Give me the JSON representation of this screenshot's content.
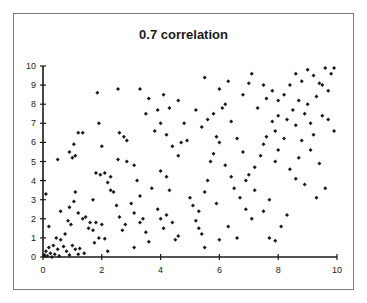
{
  "chart_data": {
    "type": "scatter",
    "title": "0.7 correlation",
    "xlabel": "",
    "ylabel": "",
    "xlim": [
      0,
      10
    ],
    "ylim": [
      0,
      10
    ],
    "x_ticks": [
      0,
      2,
      4,
      6,
      8,
      10
    ],
    "y_ticks": [
      0,
      1,
      2,
      3,
      4,
      5,
      6,
      7,
      8,
      9,
      10
    ],
    "grid": false,
    "legend": null,
    "marker": "diamond",
    "marker_color": "#1a1a1a",
    "points": [
      [
        0.05,
        0.1
      ],
      [
        0.1,
        0.3
      ],
      [
        0.15,
        0.05
      ],
      [
        0.2,
        0.5
      ],
      [
        0.25,
        0.2
      ],
      [
        0.3,
        0.0
      ],
      [
        0.35,
        0.6
      ],
      [
        0.4,
        0.15
      ],
      [
        0.5,
        0.4
      ],
      [
        0.55,
        0.05
      ],
      [
        0.1,
        3.3
      ],
      [
        0.2,
        1.6
      ],
      [
        0.45,
        1.0
      ],
      [
        0.6,
        0.9
      ],
      [
        0.7,
        0.55
      ],
      [
        0.8,
        0.3
      ],
      [
        0.9,
        0.1
      ],
      [
        0.6,
        2.4
      ],
      [
        0.85,
        1.9
      ],
      [
        0.95,
        1.7
      ],
      [
        1.0,
        0.6
      ],
      [
        1.1,
        0.4
      ],
      [
        1.2,
        0.15
      ],
      [
        1.25,
        0.45
      ],
      [
        1.4,
        0.2
      ],
      [
        0.75,
        1.2
      ],
      [
        0.9,
        2.6
      ],
      [
        1.05,
        2.9
      ],
      [
        1.1,
        3.4
      ],
      [
        1.2,
        2.3
      ],
      [
        1.35,
        2.0
      ],
      [
        1.45,
        2.1
      ],
      [
        1.55,
        1.5
      ],
      [
        1.6,
        1.8
      ],
      [
        1.7,
        1.4
      ],
      [
        1.75,
        0.75
      ],
      [
        1.8,
        1.8
      ],
      [
        1.9,
        1.0
      ],
      [
        2.0,
        1.7
      ],
      [
        2.1,
        0.95
      ],
      [
        1.0,
        5.2
      ],
      [
        1.1,
        5.3
      ],
      [
        0.9,
        5.5
      ],
      [
        1.05,
        5.9
      ],
      [
        1.2,
        6.5
      ],
      [
        1.35,
        6.5
      ],
      [
        0.5,
        5.1
      ],
      [
        1.8,
        4.4
      ],
      [
        1.95,
        4.3
      ],
      [
        2.1,
        4.4
      ],
      [
        2.2,
        3.9
      ],
      [
        2.3,
        3.5
      ],
      [
        2.4,
        3.4
      ],
      [
        2.5,
        2.7
      ],
      [
        2.6,
        2.1
      ],
      [
        2.7,
        1.4
      ],
      [
        2.8,
        1.7
      ],
      [
        2.2,
        0.3
      ],
      [
        2.3,
        4.2
      ],
      [
        1.7,
        3.0
      ],
      [
        1.9,
        7.0
      ],
      [
        1.85,
        8.6
      ],
      [
        2.55,
        8.8
      ],
      [
        2.75,
        6.3
      ],
      [
        2.85,
        6.1
      ],
      [
        2.6,
        6.5
      ],
      [
        2.0,
        5.8
      ],
      [
        2.55,
        5.1
      ],
      [
        2.85,
        5.0
      ],
      [
        3.1,
        4.8
      ],
      [
        3.2,
        4.0
      ],
      [
        3.0,
        2.8
      ],
      [
        3.1,
        2.3
      ],
      [
        3.3,
        1.8
      ],
      [
        3.4,
        2.0
      ],
      [
        3.5,
        1.3
      ],
      [
        3.6,
        0.8
      ],
      [
        3.1,
        0.5
      ],
      [
        3.3,
        3.2
      ],
      [
        3.7,
        3.6
      ],
      [
        3.9,
        2.5
      ],
      [
        4.0,
        2.0
      ],
      [
        4.1,
        1.5
      ],
      [
        4.2,
        2.2
      ],
      [
        4.4,
        1.8
      ],
      [
        4.5,
        0.9
      ],
      [
        4.6,
        1.1
      ],
      [
        4.0,
        4.5
      ],
      [
        4.2,
        4.2
      ],
      [
        4.3,
        3.5
      ],
      [
        4.4,
        5.8
      ],
      [
        4.6,
        5.3
      ],
      [
        4.7,
        6.0
      ],
      [
        3.5,
        7.5
      ],
      [
        3.8,
        6.6
      ],
      [
        4.0,
        7.0
      ],
      [
        4.2,
        6.4
      ],
      [
        4.6,
        8.2
      ],
      [
        4.8,
        7.0
      ],
      [
        4.9,
        6.1
      ],
      [
        3.3,
        8.8
      ],
      [
        3.6,
        8.3
      ],
      [
        3.9,
        7.7
      ],
      [
        4.1,
        8.5
      ],
      [
        4.3,
        7.8
      ],
      [
        5.0,
        3.1
      ],
      [
        5.1,
        2.7
      ],
      [
        5.2,
        1.9
      ],
      [
        5.3,
        1.5
      ],
      [
        5.4,
        1.2
      ],
      [
        5.5,
        0.5
      ],
      [
        5.3,
        2.4
      ],
      [
        5.5,
        3.4
      ],
      [
        5.6,
        4.0
      ],
      [
        5.7,
        5.0
      ],
      [
        5.8,
        5.4
      ],
      [
        5.9,
        6.3
      ],
      [
        6.0,
        6.0
      ],
      [
        5.4,
        6.8
      ],
      [
        5.2,
        7.7
      ],
      [
        5.6,
        7.2
      ],
      [
        5.8,
        7.5
      ],
      [
        6.1,
        7.8
      ],
      [
        6.2,
        8.0
      ],
      [
        6.0,
        8.8
      ],
      [
        6.3,
        9.2
      ],
      [
        5.5,
        9.4
      ],
      [
        6.4,
        7.1
      ],
      [
        6.6,
        6.2
      ],
      [
        6.8,
        5.5
      ],
      [
        6.2,
        4.8
      ],
      [
        6.4,
        4.2
      ],
      [
        6.5,
        3.6
      ],
      [
        6.7,
        3.1
      ],
      [
        6.9,
        2.5
      ],
      [
        7.1,
        2.0
      ],
      [
        6.3,
        1.6
      ],
      [
        6.0,
        0.9
      ],
      [
        5.9,
        2.8
      ],
      [
        6.6,
        1.0
      ],
      [
        7.0,
        4.3
      ],
      [
        7.2,
        4.7
      ],
      [
        7.4,
        5.3
      ],
      [
        7.5,
        5.9
      ],
      [
        7.6,
        6.3
      ],
      [
        7.8,
        7.1
      ],
      [
        7.9,
        6.6
      ],
      [
        8.0,
        7.4
      ],
      [
        7.3,
        7.8
      ],
      [
        7.6,
        8.3
      ],
      [
        7.8,
        8.7
      ],
      [
        7.0,
        9.1
      ],
      [
        6.8,
        8.5
      ],
      [
        7.1,
        9.6
      ],
      [
        7.5,
        9.0
      ],
      [
        8.0,
        8.2
      ],
      [
        8.2,
        8.5
      ],
      [
        8.4,
        9.0
      ],
      [
        8.6,
        9.6
      ],
      [
        8.8,
        9.2
      ],
      [
        9.0,
        9.8
      ],
      [
        9.2,
        9.5
      ],
      [
        9.4,
        9.1
      ],
      [
        9.6,
        9.9
      ],
      [
        9.8,
        9.6
      ],
      [
        9.9,
        9.9
      ],
      [
        9.5,
        9.0
      ],
      [
        9.7,
        8.7
      ],
      [
        9.3,
        8.4
      ],
      [
        9.0,
        8.0
      ],
      [
        8.7,
        8.2
      ],
      [
        8.5,
        7.7
      ],
      [
        8.3,
        7.2
      ],
      [
        8.9,
        7.5
      ],
      [
        9.1,
        7.0
      ],
      [
        9.5,
        7.4
      ],
      [
        9.7,
        7.2
      ],
      [
        8.6,
        6.9
      ],
      [
        8.8,
        6.1
      ],
      [
        9.1,
        5.6
      ],
      [
        8.2,
        6.2
      ],
      [
        8.0,
        5.6
      ],
      [
        7.9,
        5.0
      ],
      [
        8.4,
        4.6
      ],
      [
        8.6,
        4.1
      ],
      [
        8.9,
        3.8
      ],
      [
        9.3,
        3.1
      ],
      [
        9.6,
        3.6
      ],
      [
        7.7,
        3.0
      ],
      [
        7.5,
        2.4
      ],
      [
        7.7,
        1.0
      ],
      [
        8.1,
        1.6
      ],
      [
        8.3,
        2.2
      ],
      [
        7.2,
        3.5
      ],
      [
        6.9,
        4.0
      ],
      [
        8.7,
        5.2
      ],
      [
        9.2,
        6.4
      ],
      [
        9.9,
        6.6
      ],
      [
        9.4,
        4.9
      ],
      [
        7.9,
        0.85
      ]
    ]
  }
}
